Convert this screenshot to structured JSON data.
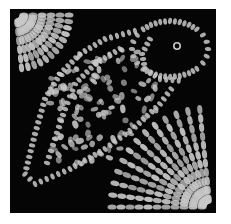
{
  "image": {
    "subject": "lace bird motif",
    "description": "Black-and-white photograph of a square lace panel with a stylized bird outlined by chains of small white stitches, fan-shaped lace corners at top-left and bottom-right",
    "colors": {
      "background": "#050505",
      "lace": "#c8c8c8",
      "page": "#ffffff"
    }
  }
}
